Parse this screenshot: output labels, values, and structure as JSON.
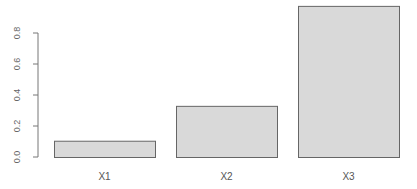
{
  "chart_data": {
    "type": "bar",
    "title": "",
    "xlabel": "",
    "ylabel": "",
    "categories": [
      "X1",
      "X2",
      "X3"
    ],
    "values": [
      0.105,
      0.33,
      0.975
    ],
    "ylim": [
      0,
      0.8
    ],
    "yticks": [
      0.0,
      0.2,
      0.4,
      0.6,
      0.8
    ],
    "ytick_labels": [
      "0.0",
      "0.2",
      "0.4",
      "0.6",
      "0.8"
    ],
    "grid": false,
    "legend": null,
    "colors": {
      "bar_fill": "#d9d9d9",
      "bar_stroke": "#666666",
      "axis": "#777777"
    }
  }
}
